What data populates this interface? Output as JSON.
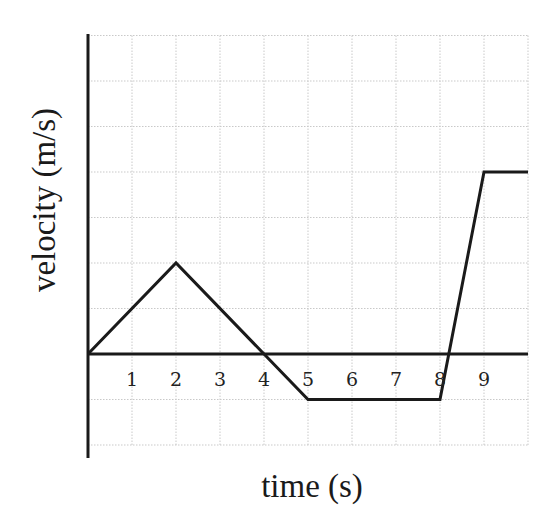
{
  "chart_data": {
    "type": "line",
    "title": "",
    "xlabel": "time (s)",
    "ylabel": "velocity (m/s)",
    "x_tick_labels": [
      "1",
      "2",
      "3",
      "4",
      "5",
      "6",
      "7",
      "8",
      "9"
    ],
    "x_ticks": [
      1,
      2,
      3,
      4,
      5,
      6,
      7,
      8,
      9
    ],
    "xlim": [
      0,
      10
    ],
    "ylim": [
      -2,
      7
    ],
    "grid": true,
    "legend": null,
    "series": [
      {
        "name": "velocity",
        "x": [
          0,
          2,
          4,
          5,
          8,
          9,
          10
        ],
        "y": [
          0,
          2,
          0,
          -1,
          -1,
          4,
          4
        ]
      }
    ]
  },
  "colors": {
    "line": "#1a1a1a",
    "grid": "#c9c9c9",
    "background": "#ffffff"
  }
}
